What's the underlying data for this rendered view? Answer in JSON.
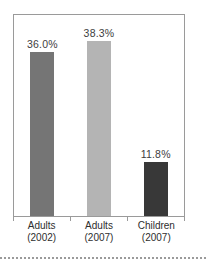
{
  "chart_data": {
    "type": "bar",
    "title": "",
    "xlabel": "",
    "ylabel": "",
    "categories": [
      "Adults (2002)",
      "Adults (2007)",
      "Children (2007)"
    ],
    "category_lines": [
      [
        "Adults",
        "(2002)"
      ],
      [
        "Adults",
        "(2007)"
      ],
      [
        "Children",
        "(2007)"
      ]
    ],
    "values": [
      36.0,
      38.3,
      11.8
    ],
    "value_labels": [
      "36.0%",
      "38.3%",
      "11.8%"
    ],
    "bar_colors": [
      "#757575",
      "#b4b4b4",
      "#383838"
    ],
    "ylim": [
      0,
      44
    ],
    "grid": false,
    "legend": "none",
    "axis_color": "#9a9a9a",
    "value_label_color": "#3d3d3d",
    "category_label_color": "#2e2e2e",
    "separator_style": "dotted",
    "separator_color": "#9a9a9a"
  }
}
